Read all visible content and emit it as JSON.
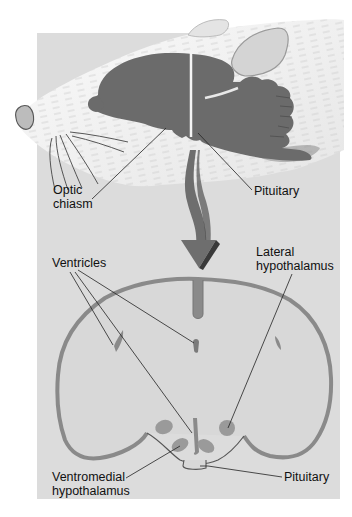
{
  "figure": {
    "colors": {
      "panel_bg": "#dcdcdc",
      "brain_fill": "#6b6b6b",
      "section_outline": "#8a8a8a",
      "nucleus_fill": "#9a9a9a",
      "arrow_fill": "#6e6e6e",
      "arrow_shadow": "#3a3a3a",
      "fur": "#f2f2f2",
      "leader_line": "#222222"
    }
  },
  "top_panel": {
    "labels": {
      "optic_chiasm_line1": "Optic",
      "optic_chiasm_line2": "chiasm",
      "pituitary": "Pituitary"
    }
  },
  "bottom_panel": {
    "labels": {
      "ventricles": "Ventricles",
      "lateral_hypothalamus_line1": "Lateral",
      "lateral_hypothalamus_line2": "hypothalamus",
      "ventromedial_line1": "Ventromedial",
      "ventromedial_line2": "hypothalamus",
      "pituitary": "Pituitary"
    }
  }
}
